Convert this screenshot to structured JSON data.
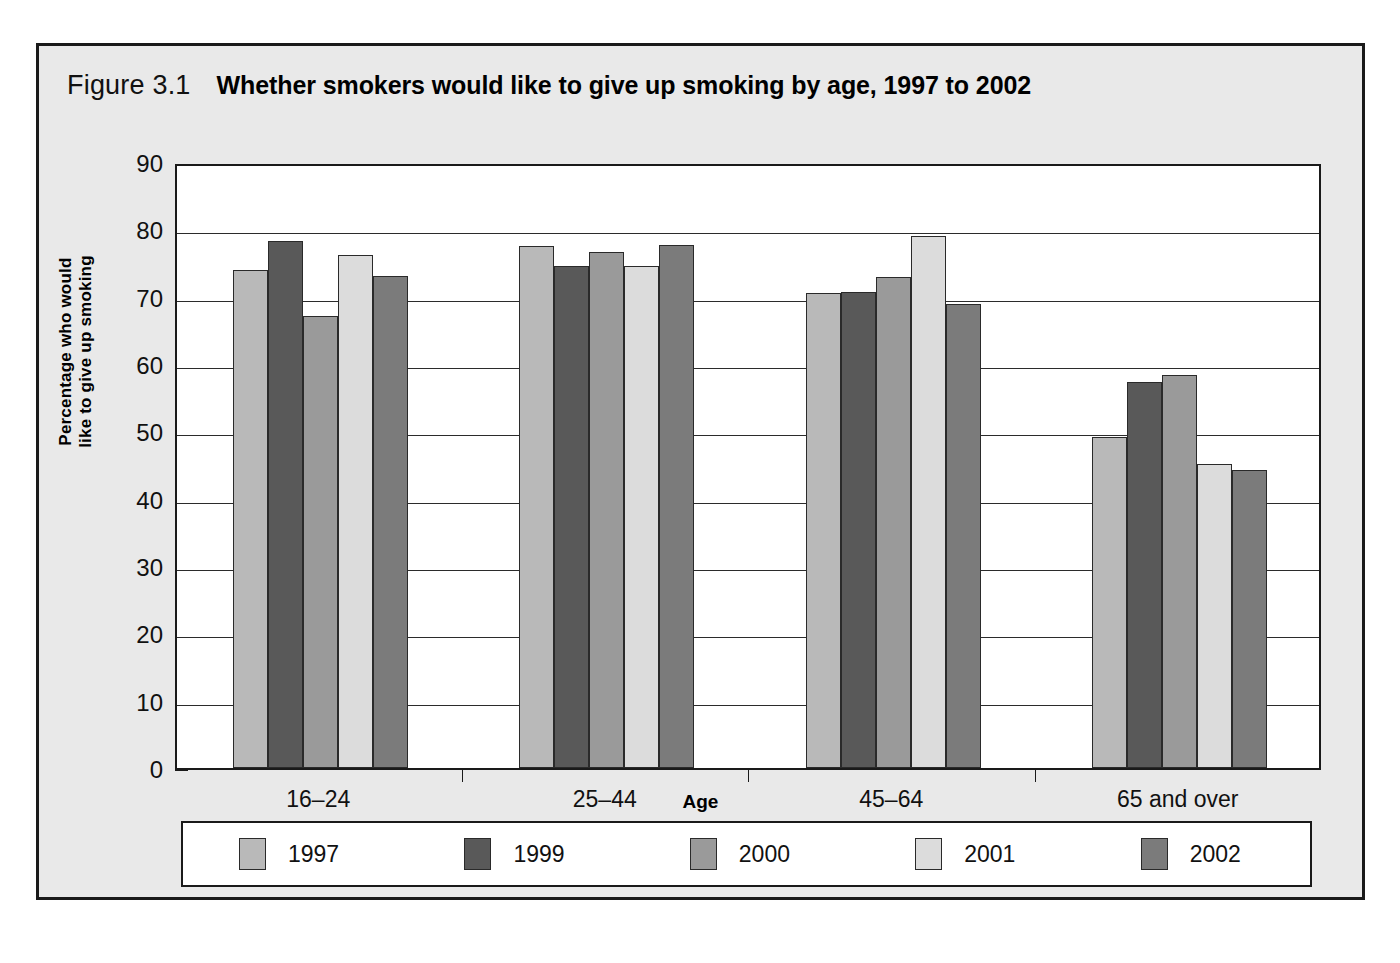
{
  "figure": {
    "number": "Figure 3.1",
    "title": "Whether smokers would like to give up smoking by age, 1997 to 2002"
  },
  "chart_data": {
    "type": "bar",
    "title": "Whether smokers would like to give up smoking by age, 1997 to 2002",
    "xlabel": "Age",
    "ylabel": "Percentage who would like to give up smoking",
    "categories": [
      "16–24",
      "25–44",
      "45–64",
      "65 and over"
    ],
    "series": [
      {
        "name": "1997",
        "color": "#b9b9b9",
        "values": [
          74.0,
          77.5,
          70.6,
          49.2
        ]
      },
      {
        "name": "1999",
        "color": "#595959",
        "values": [
          78.2,
          74.5,
          70.7,
          57.3
        ]
      },
      {
        "name": "2000",
        "color": "#9a9a9a",
        "values": [
          67.2,
          76.6,
          72.9,
          58.3
        ]
      },
      {
        "name": "2001",
        "color": "#dcdcdc",
        "values": [
          76.2,
          74.6,
          79.0,
          45.2
        ]
      },
      {
        "name": "2002",
        "color": "#7b7b7b",
        "values": [
          73.1,
          77.7,
          68.9,
          44.2
        ]
      }
    ],
    "ylim": [
      0,
      90
    ],
    "yticks": [
      0,
      10,
      20,
      30,
      40,
      50,
      60,
      70,
      80,
      90
    ],
    "ytick_labels": [
      "0",
      "10",
      "20",
      "30",
      "40",
      "50",
      "60",
      "70",
      "80",
      "90"
    ],
    "grid": true,
    "legend_position": "bottom",
    "legend_entries": [
      "1997",
      "1999",
      "2000",
      "2001",
      "2002"
    ]
  },
  "y_axis_title_lines": {
    "line1": "Percentage who would",
    "line2": "like to give up smoking"
  }
}
